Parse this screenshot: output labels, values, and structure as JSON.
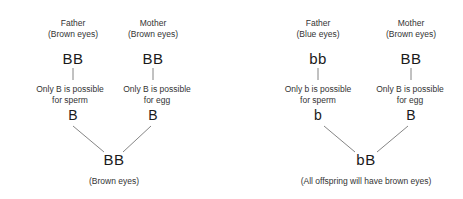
{
  "crosses": [
    {
      "father": {
        "label": "Father",
        "phenotype": "(Brown eyes)",
        "genotype": "BB",
        "gamete_note_line1": "Only B is possible",
        "gamete_note_line2": "for sperm",
        "gamete": "B"
      },
      "mother": {
        "label": "Mother",
        "phenotype": "(Brown eyes)",
        "genotype": "BB",
        "gamete_note_line1": "Only B is possible",
        "gamete_note_line2": "for egg",
        "gamete": "B"
      },
      "offspring": {
        "genotype": "BB",
        "phenotype": "(Brown eyes)"
      }
    },
    {
      "father": {
        "label": "Father",
        "phenotype": "(Blue eyes)",
        "genotype": "bb",
        "gamete_note_line1": "Only b is possible",
        "gamete_note_line2": "for sperm",
        "gamete": "b"
      },
      "mother": {
        "label": "Mother",
        "phenotype": "(Brown eyes)",
        "genotype": "BB",
        "gamete_note_line1": "Only B is possible",
        "gamete_note_line2": "for egg",
        "gamete": "B"
      },
      "offspring": {
        "genotype": "bB",
        "phenotype": "(All offspring will have brown eyes)"
      }
    }
  ]
}
